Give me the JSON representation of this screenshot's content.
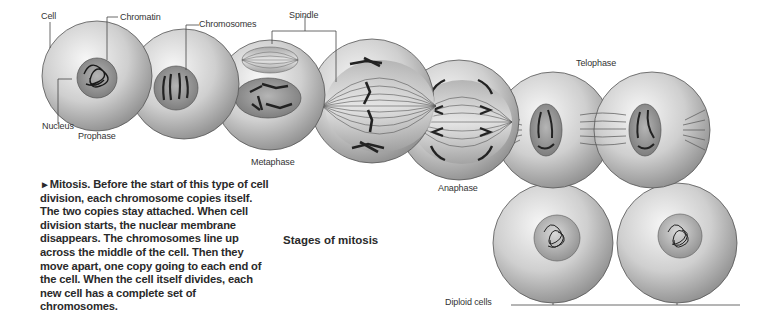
{
  "figure": {
    "title": "Stages of mitosis",
    "caption": {
      "marker": "►",
      "text": "Mitosis. Before the start of this type of cell division, each chromosome copies itself. The two copies stay attached. When cell division starts, the nuclear membrane disappears. The chromosomes line up across the middle of the cell. Then they move apart, one copy going to each end of the cell. When the cell itself divides, each new cell has a complete set of chromosomes."
    },
    "labels": {
      "cell": "Cell",
      "chromatin": "Chromatin",
      "chromosomes": "Chromosomes",
      "spindle": "Spindle",
      "nucleus": "Nucleus",
      "prophase": "Prophase",
      "metaphase": "Metaphase",
      "anaphase": "Anaphase",
      "telophase": "Telophase",
      "diploid_cells": "Diploid cells"
    },
    "stages": [
      "Prophase",
      "Metaphase",
      "Anaphase",
      "Telophase",
      "Diploid cells"
    ],
    "colors": {
      "cell_light": "#f2f2f2",
      "cell_dark": "#8a8a8a",
      "nucleus": "#9a9a9a",
      "chromosome": "#222222",
      "leader_line": "#444444"
    }
  }
}
